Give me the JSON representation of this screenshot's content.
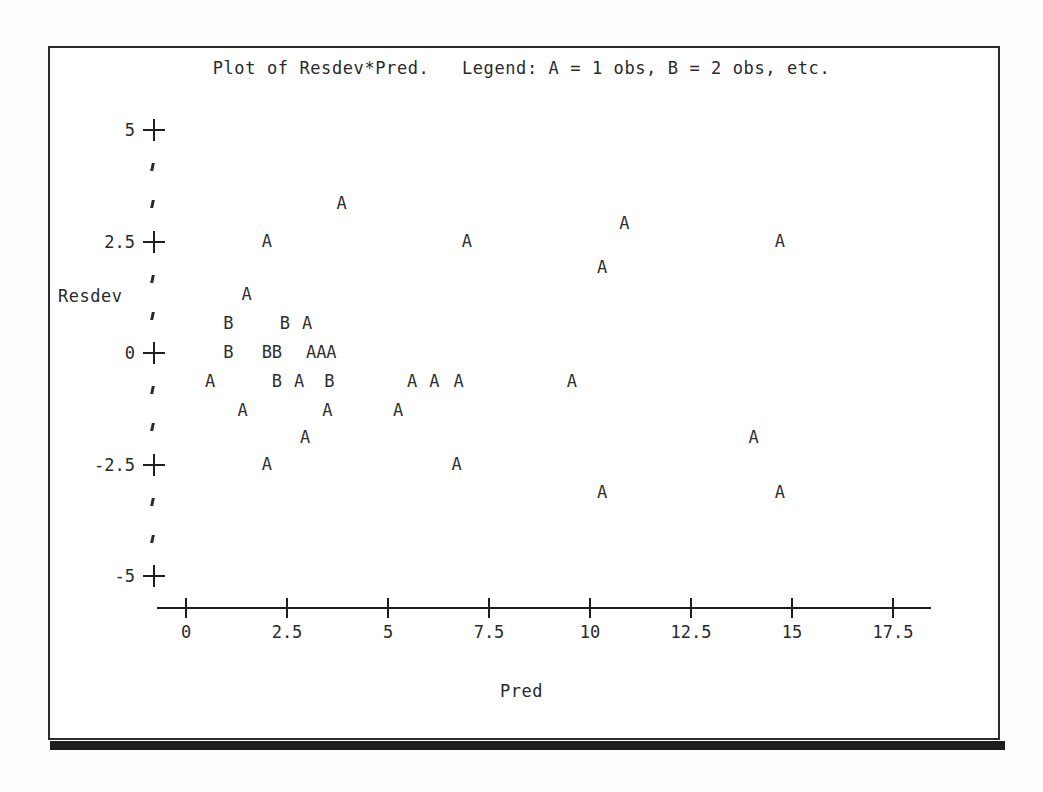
{
  "plot": {
    "title": "Plot of Resdev*Pred.   Legend: A = 1 obs, B = 2 obs, etc.",
    "x_axis_title": "Pred",
    "y_axis_title": "Resdev",
    "frame_color": "#2b2b2b",
    "ink_color": "#2a2a2a"
  },
  "chart_data": {
    "type": "scatter",
    "title": "Plot of Resdev*Pred.   Legend: A = 1 obs, B = 2 obs, etc.",
    "xlabel": "Pred",
    "ylabel": "Resdev",
    "xlim": [
      -0.7,
      18.4
    ],
    "ylim": [
      -5.6,
      5.6
    ],
    "xticks": [
      0,
      2.5,
      5,
      7.5,
      10,
      12.5,
      15,
      17.5
    ],
    "xticklabels": [
      "0",
      "2.5",
      "5",
      "7.5",
      "10",
      "12.5",
      "15",
      "17.5"
    ],
    "yticks": [
      5,
      2.5,
      0,
      -2.5,
      -5
    ],
    "yticklabels": [
      "5",
      "2.5",
      "0",
      "-2.5",
      "-5"
    ],
    "y_minor_ticks_per_interval": 2,
    "grid": false,
    "legend": "A = 1 obs, B = 2 obs, etc.",
    "marker_scheme": {
      "A": 1,
      "B": 2
    },
    "points": [
      {
        "label": "A",
        "x": 3.85,
        "y": 3.35
      },
      {
        "label": "A",
        "x": 10.85,
        "y": 2.9
      },
      {
        "label": "A",
        "x": 2.0,
        "y": 2.5
      },
      {
        "label": "A",
        "x": 6.95,
        "y": 2.5
      },
      {
        "label": "A",
        "x": 14.7,
        "y": 2.5
      },
      {
        "label": "A",
        "x": 10.3,
        "y": 1.9
      },
      {
        "label": "A",
        "x": 1.5,
        "y": 1.3
      },
      {
        "label": "B",
        "x": 1.05,
        "y": 0.65
      },
      {
        "label": "B",
        "x": 2.45,
        "y": 0.65
      },
      {
        "label": "A",
        "x": 3.0,
        "y": 0.65
      },
      {
        "label": "B",
        "x": 1.05,
        "y": 0.0
      },
      {
        "label": "B",
        "x": 2.0,
        "y": 0.0
      },
      {
        "label": "B",
        "x": 2.25,
        "y": 0.0
      },
      {
        "label": "A",
        "x": 3.1,
        "y": 0.0
      },
      {
        "label": "A",
        "x": 3.35,
        "y": 0.0
      },
      {
        "label": "A",
        "x": 3.6,
        "y": 0.0
      },
      {
        "label": "A",
        "x": 0.6,
        "y": -0.65
      },
      {
        "label": "B",
        "x": 2.25,
        "y": -0.65
      },
      {
        "label": "A",
        "x": 2.8,
        "y": -0.65
      },
      {
        "label": "B",
        "x": 3.55,
        "y": -0.65
      },
      {
        "label": "A",
        "x": 5.6,
        "y": -0.65
      },
      {
        "label": "A",
        "x": 6.15,
        "y": -0.65
      },
      {
        "label": "A",
        "x": 6.75,
        "y": -0.65
      },
      {
        "label": "A",
        "x": 9.55,
        "y": -0.65
      },
      {
        "label": "A",
        "x": 1.4,
        "y": -1.3
      },
      {
        "label": "A",
        "x": 3.5,
        "y": -1.3
      },
      {
        "label": "A",
        "x": 5.25,
        "y": -1.3
      },
      {
        "label": "A",
        "x": 2.95,
        "y": -1.9
      },
      {
        "label": "A",
        "x": 14.05,
        "y": -1.9
      },
      {
        "label": "A",
        "x": 2.0,
        "y": -2.5
      },
      {
        "label": "A",
        "x": 6.7,
        "y": -2.5
      },
      {
        "label": "A",
        "x": 10.3,
        "y": -3.15
      },
      {
        "label": "A",
        "x": 14.7,
        "y": -3.15
      }
    ]
  }
}
